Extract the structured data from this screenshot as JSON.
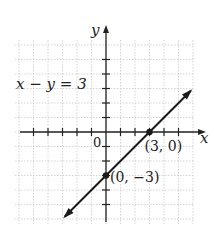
{
  "chart_data": {
    "type": "line",
    "title": "",
    "xlabel": "x",
    "ylabel": "y",
    "equation": "x − y = 3",
    "origin_label": "0",
    "xlim": [
      -5,
      5
    ],
    "ylim": [
      -5,
      5
    ],
    "grid": true,
    "tick_step": 1,
    "series": [
      {
        "name": "x − y = 3",
        "x": [
          -4,
          6
        ],
        "y": [
          -7,
          3
        ],
        "arrows": "both"
      }
    ],
    "points": [
      {
        "x": 3,
        "y": 0,
        "label": "(3, 0)"
      },
      {
        "x": 0,
        "y": -3,
        "label": "(0, −3)"
      }
    ],
    "colors": {
      "line": "#1a1a1a",
      "grid": "#c8c8c8",
      "axis": "#222222"
    }
  }
}
